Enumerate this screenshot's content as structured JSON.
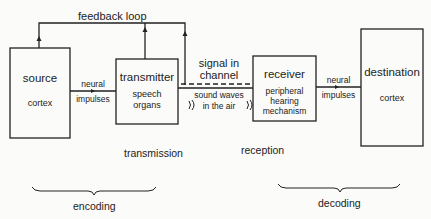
{
  "diagram": {
    "feedback_label": "feedback loop",
    "boxes": {
      "source": {
        "title": "source",
        "sub": "cortex"
      },
      "transmitter": {
        "title": "transmitter",
        "sub1": "speech",
        "sub2": "organs"
      },
      "receiver": {
        "title": "receiver",
        "sub1": "peripheral",
        "sub2": "hearing",
        "sub3": "mechanism"
      },
      "destination": {
        "title": "destination",
        "sub": "cortex"
      }
    },
    "links": {
      "source_to_transmitter": {
        "line1": "neural",
        "line2": "impulses"
      },
      "channel": {
        "line1": "signal in",
        "line2": "channel"
      },
      "sound": {
        "line1": "sound waves",
        "line2": "in the air"
      },
      "receiver_to_destination": {
        "line1": "neural",
        "line2": "impulses"
      }
    },
    "stages": {
      "transmission": "transmission",
      "reception": "reception",
      "encoding": "encoding",
      "decoding": "decoding"
    }
  }
}
